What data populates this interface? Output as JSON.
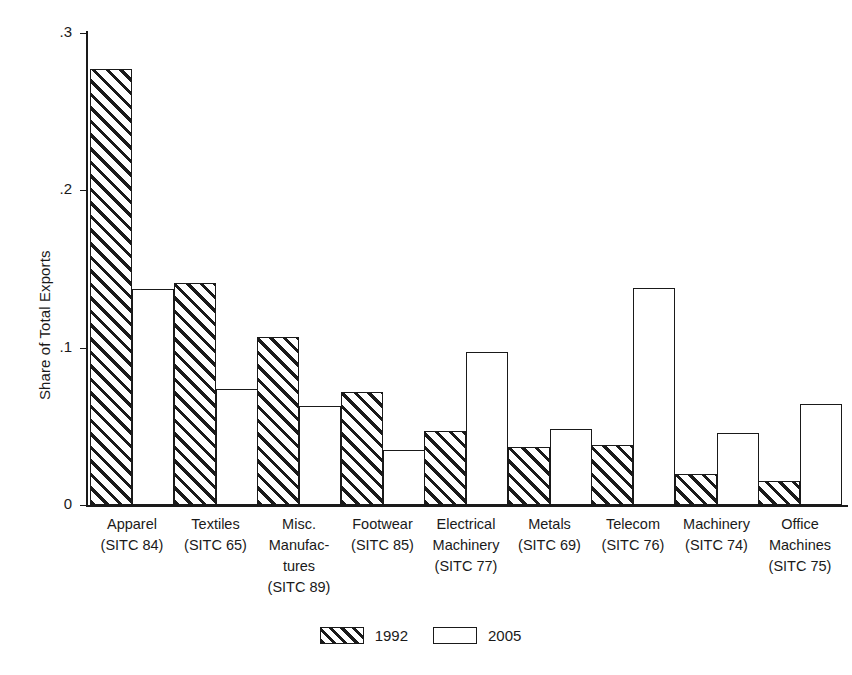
{
  "chart_data": {
    "type": "bar",
    "title": "",
    "xlabel": "",
    "ylabel": "Share of Total Exports",
    "ylim": [
      0,
      0.3
    ],
    "yticks": [
      "0",
      ".1",
      ".2",
      ".3"
    ],
    "ytick_values": [
      0,
      0.1,
      0.2,
      0.3
    ],
    "grid": false,
    "legend_position": "bottom",
    "categories": [
      "Apparel\n(SITC 84)",
      "Textiles\n(SITC 65)",
      "Misc.\nManufac-\ntures\n(SITC 89)",
      "Footwear\n(SITC 85)",
      "Electrical\nMachinery\n(SITC 77)",
      "Metals\n(SITC 69)",
      "Telecom\n(SITC 76)",
      "Machinery\n(SITC 74)",
      "Office\nMachines\n(SITC 75)"
    ],
    "series": [
      {
        "name": "1992",
        "pattern": "hatched",
        "values": [
          0.277,
          0.141,
          0.107,
          0.072,
          0.047,
          0.037,
          0.038,
          0.02,
          0.015
        ]
      },
      {
        "name": "2005",
        "pattern": "open",
        "values": [
          0.137,
          0.074,
          0.063,
          0.035,
          0.097,
          0.048,
          0.138,
          0.046,
          0.064
        ]
      }
    ]
  },
  "legend": {
    "entries": [
      {
        "label": "1992",
        "pattern": "hatched"
      },
      {
        "label": "2005",
        "pattern": "open"
      }
    ]
  },
  "colors": {
    "ink": "#1a1a1a",
    "background": "#ffffff"
  }
}
